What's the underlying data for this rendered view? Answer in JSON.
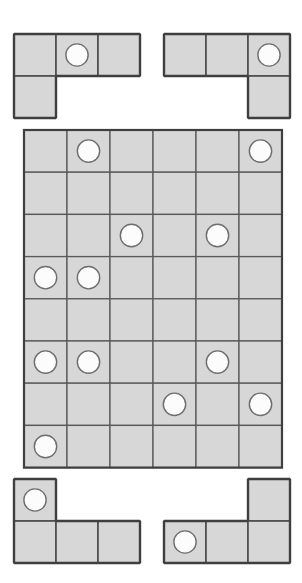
{
  "puzzle": {
    "title": "Peg Grid Packing Puzzle",
    "cell_size": 43,
    "colors": {
      "cell_fill": "#d7d7d7",
      "cell_stroke": "#5a5a5a",
      "outline_stroke": "#3f3f3f",
      "peg_fill": "#fcfcfc",
      "peg_stroke": "#6e6e6e",
      "background": "#ffffff"
    },
    "board": {
      "name": "main-grid",
      "origin": {
        "x": 22,
        "y": 128
      },
      "columns": 6,
      "rows": 8,
      "cell_w": 43,
      "cell_h": 42.2,
      "pegs": [
        {
          "row": 1,
          "col": 2
        },
        {
          "row": 1,
          "col": 6
        },
        {
          "row": 3,
          "col": 3
        },
        {
          "row": 3,
          "col": 5
        },
        {
          "row": 4,
          "col": 1
        },
        {
          "row": 4,
          "col": 2
        },
        {
          "row": 6,
          "col": 1
        },
        {
          "row": 6,
          "col": 2
        },
        {
          "row": 6,
          "col": 5
        },
        {
          "row": 7,
          "col": 4
        },
        {
          "row": 7,
          "col": 6
        },
        {
          "row": 8,
          "col": 1
        }
      ],
      "peg_count": 12
    },
    "pieces": [
      {
        "id": "piece-top-left",
        "label": "Top Left Piece",
        "origin": {
          "x": 12,
          "y": 32
        },
        "cell_w": 42,
        "cell_h": 42,
        "cells": [
          {
            "row": 0,
            "col": 0
          },
          {
            "row": 0,
            "col": 1
          },
          {
            "row": 0,
            "col": 2
          },
          {
            "row": 1,
            "col": 0
          }
        ],
        "pegs": [
          {
            "row": 0,
            "col": 1
          }
        ],
        "cell_count": 4,
        "peg_count": 1
      },
      {
        "id": "piece-top-right",
        "label": "Top Right Piece",
        "origin": {
          "x": 162,
          "y": 32
        },
        "cell_w": 42,
        "cell_h": 42,
        "cells": [
          {
            "row": 0,
            "col": 0
          },
          {
            "row": 0,
            "col": 1
          },
          {
            "row": 0,
            "col": 2
          },
          {
            "row": 1,
            "col": 2
          }
        ],
        "pegs": [
          {
            "row": 0,
            "col": 2
          }
        ],
        "cell_count": 4,
        "peg_count": 1
      },
      {
        "id": "piece-bottom-left",
        "label": "Bottom Left Piece",
        "origin": {
          "x": 12,
          "y": 477
        },
        "cell_w": 42,
        "cell_h": 42,
        "cells": [
          {
            "row": 0,
            "col": 0
          },
          {
            "row": 1,
            "col": 0
          },
          {
            "row": 1,
            "col": 1
          },
          {
            "row": 1,
            "col": 2
          }
        ],
        "pegs": [
          {
            "row": 0,
            "col": 0
          }
        ],
        "cell_count": 4,
        "peg_count": 1
      },
      {
        "id": "piece-bottom-right",
        "label": "Bottom Right Piece",
        "origin": {
          "x": 162,
          "y": 477
        },
        "cell_w": 42,
        "cell_h": 42,
        "cells": [
          {
            "row": 0,
            "col": 2
          },
          {
            "row": 1,
            "col": 0
          },
          {
            "row": 1,
            "col": 1
          },
          {
            "row": 1,
            "col": 2
          }
        ],
        "pegs": [
          {
            "row": 1,
            "col": 0
          }
        ],
        "cell_count": 4,
        "peg_count": 1
      }
    ]
  }
}
